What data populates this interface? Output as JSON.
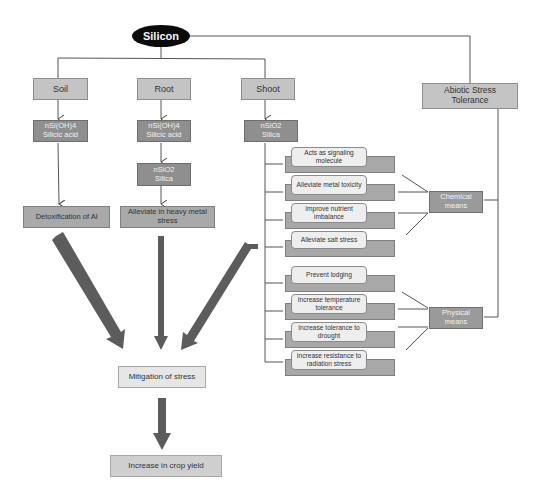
{
  "root": {
    "label": "Silicon"
  },
  "branches": [
    {
      "label": "Soil",
      "form": {
        "line1": "nSi(OH)4",
        "line2": "Silicic acid"
      },
      "effect": "Detoxification of Al"
    },
    {
      "label": "Root",
      "form": {
        "line1": "nSi(OH)4",
        "line2": "Silicic acid"
      },
      "form2": {
        "line1": "nSiO2",
        "line2": "Silica"
      },
      "effect": "Alleviate in heavy metal stress"
    },
    {
      "label": "Shoot",
      "form": {
        "line1": "nSiO2",
        "line2": "Silica"
      }
    }
  ],
  "abiotic": {
    "label": "Abiotic Stress Tolerance"
  },
  "shoot_effects": [
    {
      "label": "Acts  as signaling molecule"
    },
    {
      "label": "Alleviate metal toxicity"
    },
    {
      "label": "Improve nutrient imbalance"
    },
    {
      "label": "Alleviate salt stress"
    },
    {
      "label": "Prevent lodging"
    },
    {
      "label": "Increase temperature tolerance"
    },
    {
      "label": "Increase tolerance to drought"
    },
    {
      "label": "Increase  resistance to radiation stress"
    }
  ],
  "means": {
    "chemical": "Chemical means",
    "physical": "Physical means"
  },
  "outcomes": {
    "mitigation": "Mitigation of stress",
    "yield": "Increase in crop yield"
  },
  "colors": {
    "ellipse": "#0b0b0b",
    "light_box": "#c4c4c4",
    "dark_box": "#8f8f8f",
    "line": "#555555",
    "thick_arrow": "#5a5a5a",
    "outcome_box": "#e6e6e6"
  }
}
